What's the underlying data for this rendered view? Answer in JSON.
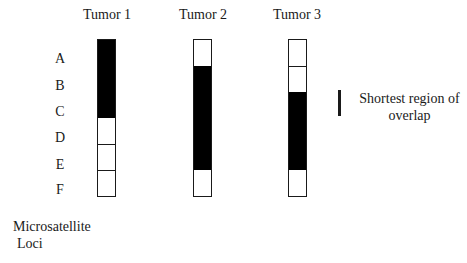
{
  "diagram": {
    "type": "loss-of-heterozygosity map",
    "loci": [
      "A",
      "B",
      "C",
      "D",
      "E",
      "F"
    ],
    "loci_axis_label": [
      "Microsatellite",
      "Loci"
    ],
    "colors": {
      "filled": "#000000",
      "empty": "#ffffff",
      "border": "#1a1a1a"
    },
    "tumors": [
      {
        "name": "Tumor 1",
        "cells": [
          1,
          1,
          1,
          0,
          0,
          0
        ]
      },
      {
        "name": "Tumor 2",
        "cells": [
          0,
          1,
          1,
          1,
          1,
          0
        ]
      },
      {
        "name": "Tumor 3",
        "cells": [
          0,
          0,
          1,
          1,
          1,
          0
        ]
      }
    ],
    "legend": {
      "symbol": "vertical-bar",
      "text_line1": "Shortest region of",
      "text_line2": "overlap"
    }
  }
}
